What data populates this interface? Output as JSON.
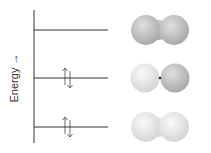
{
  "diagram": {
    "type": "molecular orbital energy diagram",
    "axis_label": "Energy →",
    "axis_label_text": "Energy",
    "levels": [
      {
        "name": "top",
        "electrons": 0,
        "orbital": "both lobes gray, joined with bridge"
      },
      {
        "name": "middle",
        "electrons": 2,
        "spins": "up-down",
        "orbital": "left lobe light, right lobe dark, node between"
      },
      {
        "name": "bottom",
        "electrons": 2,
        "spins": "up-down",
        "orbital": "both lobes light, joined with bridge"
      }
    ],
    "colors": {
      "line": "#333333",
      "light_lobe": "#e6e6e6",
      "dark_lobe": "#b5b5b5"
    }
  }
}
